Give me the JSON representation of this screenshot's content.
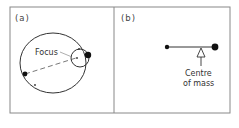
{
  "panels": [
    {
      "id": "a",
      "label": "(a)",
      "annotations": {
        "focus": "Focus"
      },
      "description": "Elliptical orbit with small circular orbit around focus"
    },
    {
      "id": "b",
      "label": "(b)",
      "annotations": {
        "centre_line1": "Centre",
        "centre_line2": "of mass"
      },
      "description": "Two masses joined by a rod balanced at centre of mass"
    }
  ],
  "colors": {
    "line": "#333333",
    "frame": "#888888",
    "mass": "#111111"
  }
}
